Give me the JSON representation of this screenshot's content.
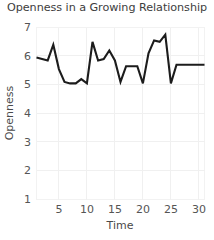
{
  "chart_data": {
    "type": "line",
    "title": "Openness in a Growing Relationship",
    "xlabel": "Time",
    "ylabel": "Openness",
    "xlim": [
      1,
      31
    ],
    "ylim": [
      1,
      7
    ],
    "xticks": [
      5,
      10,
      15,
      20,
      25,
      30
    ],
    "yticks": [
      1,
      2,
      3,
      4,
      5,
      6,
      7
    ],
    "grid": true,
    "legend": "none",
    "line_color": "#1c1c1c",
    "x": [
      1,
      2,
      3,
      4,
      5,
      6,
      7,
      8,
      9,
      10,
      11,
      12,
      13,
      14,
      15,
      16,
      17,
      18,
      19,
      20,
      21,
      22,
      23,
      24,
      25,
      26,
      27,
      28,
      29,
      30,
      31
    ],
    "values": [
      5.95,
      5.9,
      5.85,
      6.4,
      5.55,
      5.1,
      5.05,
      5.05,
      5.2,
      5.05,
      6.5,
      5.85,
      5.9,
      6.2,
      5.85,
      5.1,
      5.65,
      5.65,
      5.65,
      5.05,
      6.1,
      6.55,
      6.5,
      6.75,
      5.05,
      5.7,
      5.7,
      5.7,
      5.7,
      5.7,
      5.7
    ],
    "series": [
      {
        "name": "Openness",
        "values": [
          5.95,
          5.9,
          5.85,
          6.4,
          5.55,
          5.1,
          5.05,
          5.05,
          5.2,
          5.05,
          6.5,
          5.85,
          5.9,
          6.2,
          5.85,
          5.1,
          5.65,
          5.65,
          5.65,
          5.05,
          6.1,
          6.55,
          6.5,
          6.75,
          5.05,
          5.7,
          5.7,
          5.7,
          5.7,
          5.7,
          5.7
        ]
      }
    ]
  },
  "axis": {
    "x_tick_labels": [
      "5",
      "10",
      "15",
      "20",
      "25",
      "30"
    ],
    "y_tick_labels": [
      "1",
      "2",
      "3",
      "4",
      "5",
      "6",
      "7"
    ]
  }
}
